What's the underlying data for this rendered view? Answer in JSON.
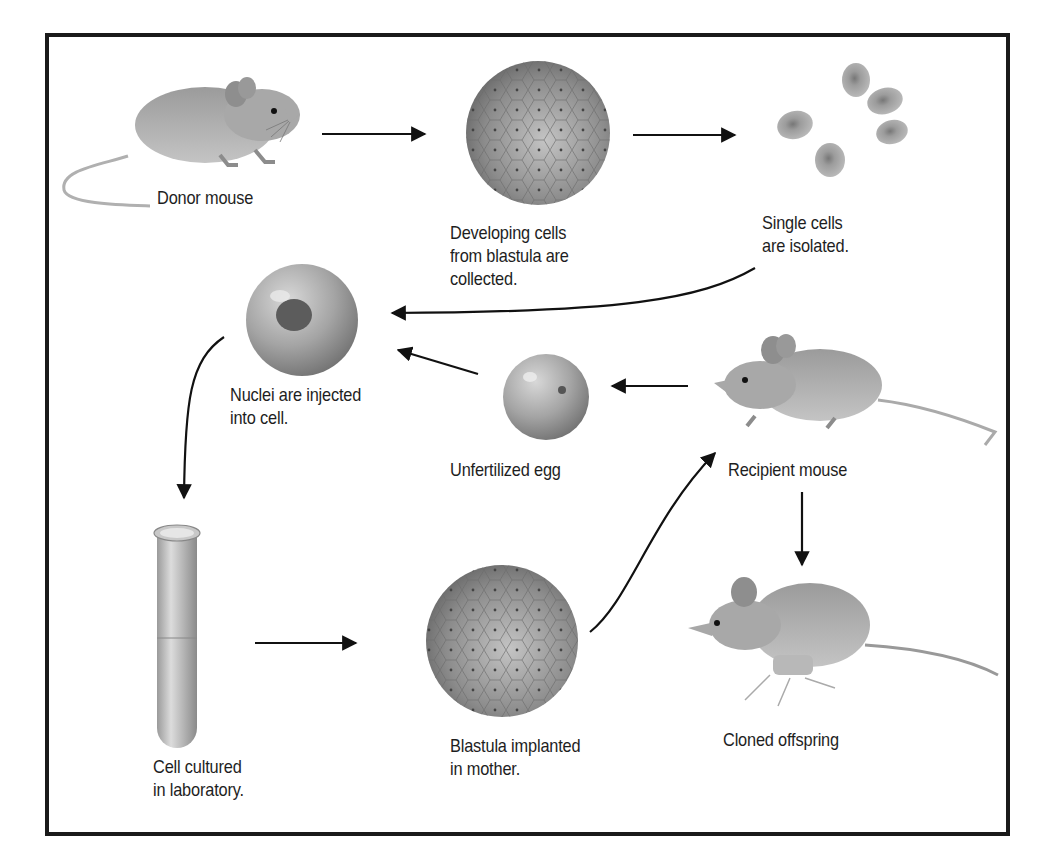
{
  "diagram": {
    "colors": {
      "border": "#1a1a1a",
      "background": "#ffffff",
      "fur": "#a8a8a8",
      "cell": "#9a9a9a",
      "text": "#1e1e1e"
    },
    "steps": [
      {
        "id": "donor",
        "label": "Donor mouse",
        "icon": "donor-mouse"
      },
      {
        "id": "blastula-cells",
        "label": "Developing cells\nfrom blastula are\ncollected.",
        "icon": "blastula"
      },
      {
        "id": "single-cells",
        "label": "Single cells\nare isolated.",
        "icon": "single-cells"
      },
      {
        "id": "nuclei-injected",
        "label": "Nuclei are injected\ninto cell.",
        "icon": "egg-with-nucleus"
      },
      {
        "id": "unfertilized-egg",
        "label": "Unfertilized egg",
        "icon": "egg"
      },
      {
        "id": "recipient",
        "label": "Recipient mouse",
        "icon": "recipient-mouse"
      },
      {
        "id": "cultured",
        "label": "Cell cultured\nin laboratory.",
        "icon": "test-tube"
      },
      {
        "id": "implanted",
        "label": "Blastula implanted\nin mother.",
        "icon": "blastula"
      },
      {
        "id": "offspring",
        "label": "Cloned offspring",
        "icon": "cloned-mouse"
      }
    ],
    "flow": [
      {
        "from": "donor",
        "to": "blastula-cells"
      },
      {
        "from": "blastula-cells",
        "to": "single-cells"
      },
      {
        "from": "single-cells",
        "to": "nuclei-injected"
      },
      {
        "from": "recipient",
        "to": "unfertilized-egg"
      },
      {
        "from": "unfertilized-egg",
        "to": "nuclei-injected"
      },
      {
        "from": "nuclei-injected",
        "to": "cultured"
      },
      {
        "from": "cultured",
        "to": "implanted"
      },
      {
        "from": "implanted",
        "to": "recipient"
      },
      {
        "from": "recipient",
        "to": "offspring"
      }
    ]
  }
}
